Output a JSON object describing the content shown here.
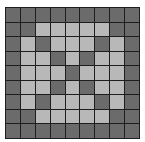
{
  "board": {
    "rows": 9,
    "cols": 9,
    "colors": {
      "dark": "#6b6b6b",
      "light": "#b8b8b8",
      "grid_line": "#1e1e1e"
    },
    "cells": [
      [
        "D",
        "D",
        "D",
        "D",
        "D",
        "D",
        "D",
        "D",
        "D"
      ],
      [
        "D",
        "D",
        "L",
        "L",
        "L",
        "L",
        "L",
        "D",
        "D"
      ],
      [
        "D",
        "L",
        "D",
        "L",
        "L",
        "L",
        "D",
        "L",
        "D"
      ],
      [
        "D",
        "L",
        "L",
        "D",
        "L",
        "D",
        "L",
        "L",
        "D"
      ],
      [
        "D",
        "L",
        "L",
        "L",
        "D",
        "L",
        "L",
        "L",
        "D"
      ],
      [
        "D",
        "L",
        "L",
        "D",
        "L",
        "D",
        "L",
        "L",
        "D"
      ],
      [
        "D",
        "L",
        "D",
        "L",
        "L",
        "L",
        "D",
        "L",
        "D"
      ],
      [
        "D",
        "D",
        "L",
        "L",
        "L",
        "L",
        "L",
        "D",
        "D"
      ],
      [
        "D",
        "D",
        "D",
        "D",
        "D",
        "D",
        "D",
        "D",
        "D"
      ]
    ]
  }
}
